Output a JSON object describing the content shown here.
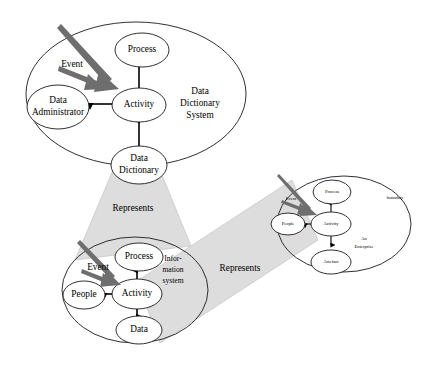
{
  "diagram": {
    "colors": {
      "background": "#ffffff",
      "outline": "#1a1a1a",
      "cone_fill": "#dddddd",
      "gray_arrow": "#6e6e6e",
      "link": "#000000"
    },
    "top_system": {
      "zone_label": "Data\nDictionary\nSystem",
      "zone_label_lines": [
        "Data",
        "Dictionary",
        "System"
      ],
      "event_label": "Event",
      "nodes": [
        {
          "id": "process",
          "label": "Process"
        },
        {
          "id": "activity",
          "label": "Activity"
        },
        {
          "id": "data-administrator",
          "label_lines": [
            "Data",
            "Administrator"
          ]
        },
        {
          "id": "data-dictionary",
          "label_lines": [
            "Data",
            "Dictionary"
          ]
        }
      ]
    },
    "middle_system": {
      "zone_label_lines": [
        "Infor-",
        "mation",
        "system"
      ],
      "event_label": "Event",
      "nodes": [
        {
          "id": "process",
          "label": "Process"
        },
        {
          "id": "activity",
          "label": "Activity"
        },
        {
          "id": "people",
          "label": "People"
        },
        {
          "id": "data",
          "label": "Data"
        }
      ]
    },
    "right_system": {
      "zone_label_lines": [
        "An",
        "Enterprise"
      ],
      "boundary_label": "boundary",
      "event_label": "Event",
      "nodes": [
        {
          "id": "process",
          "label": "Process"
        },
        {
          "id": "activity",
          "label": "Activity"
        },
        {
          "id": "people",
          "label": "People"
        },
        {
          "id": "artefact",
          "label": "Artefact"
        }
      ]
    },
    "relations": [
      {
        "id": "represents-upper",
        "label": "Represents"
      },
      {
        "id": "represents-lower",
        "label": "Represents"
      }
    ]
  }
}
